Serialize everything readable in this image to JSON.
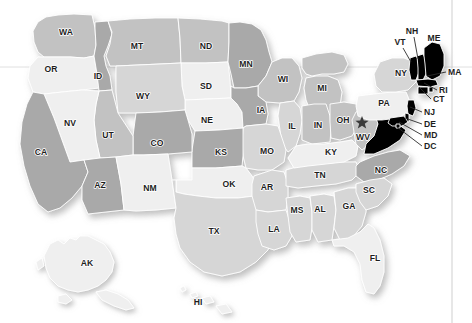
{
  "map": {
    "title": "United States choropleth map",
    "width": 472,
    "height": 323,
    "background_color": "#ffffff",
    "border_color": "#ffffff",
    "guide_line_color": "#d8d8d8",
    "right_rule_color": "#c9c9c9",
    "shade_levels": {
      "light": "#efefef",
      "medium_light": "#d6d6d6",
      "medium": "#c2c2c2",
      "dark": "#a9a9a9"
    },
    "marker": {
      "name": "star-marker",
      "state": "WV",
      "glyph": "star",
      "color": "#3a3a3a",
      "x": 362,
      "y": 122
    },
    "states": [
      {
        "code": "WA",
        "label_x": 66,
        "label_y": 33,
        "shade": "medium"
      },
      {
        "code": "OR",
        "label_x": 51,
        "label_y": 70,
        "shade": "light"
      },
      {
        "code": "ID",
        "label_x": 98,
        "label_y": 77,
        "shade": "dark"
      },
      {
        "code": "MT",
        "label_x": 137,
        "label_y": 47,
        "shade": "medium"
      },
      {
        "code": "ND",
        "label_x": 206,
        "label_y": 47,
        "shade": "medium"
      },
      {
        "code": "MN",
        "label_x": 246,
        "label_y": 65,
        "shade": "dark"
      },
      {
        "code": "WI",
        "label_x": 283,
        "label_y": 80,
        "shade": "medium"
      },
      {
        "code": "SD",
        "label_x": 206,
        "label_y": 87,
        "shade": "light"
      },
      {
        "code": "WY",
        "label_x": 143,
        "label_y": 97,
        "shade": "medium_light"
      },
      {
        "code": "NV",
        "label_x": 70,
        "label_y": 124,
        "shade": "light"
      },
      {
        "code": "UT",
        "label_x": 108,
        "label_y": 136,
        "shade": "medium"
      },
      {
        "code": "CO",
        "label_x": 157,
        "label_y": 144,
        "shade": "dark"
      },
      {
        "code": "NE",
        "label_x": 207,
        "label_y": 121,
        "shade": "light"
      },
      {
        "code": "IA",
        "label_x": 261,
        "label_y": 111,
        "shade": "dark"
      },
      {
        "code": "MI",
        "label_x": 322,
        "label_y": 89,
        "shade": "medium"
      },
      {
        "code": "IL",
        "label_x": 292,
        "label_y": 127,
        "shade": "medium_light"
      },
      {
        "code": "IN",
        "label_x": 318,
        "label_y": 126,
        "shade": "medium"
      },
      {
        "code": "OH",
        "label_x": 343,
        "label_y": 121,
        "shade": "medium"
      },
      {
        "code": "PA",
        "label_x": 384,
        "label_y": 104,
        "shade": "light"
      },
      {
        "code": "NY",
        "label_x": 401,
        "label_y": 74,
        "shade": "medium_light"
      },
      {
        "code": "CA",
        "label_x": 41,
        "label_y": 153,
        "shade": "dark"
      },
      {
        "code": "KS",
        "label_x": 221,
        "label_y": 153,
        "shade": "dark"
      },
      {
        "code": "MO",
        "label_x": 267,
        "label_y": 152,
        "shade": "medium_light"
      },
      {
        "code": "KY",
        "label_x": 331,
        "label_y": 153,
        "shade": "light"
      },
      {
        "code": "WV",
        "label_x": 363,
        "label_y": 138,
        "shade": "medium"
      },
      {
        "code": "AZ",
        "label_x": 100,
        "label_y": 186,
        "shade": "dark"
      },
      {
        "code": "NM",
        "label_x": 150,
        "label_y": 189,
        "shade": "light"
      },
      {
        "code": "OK",
        "label_x": 229,
        "label_y": 185,
        "shade": "light"
      },
      {
        "code": "AR",
        "label_x": 267,
        "label_y": 188,
        "shade": "medium_light"
      },
      {
        "code": "TN",
        "label_x": 320,
        "label_y": 176,
        "shade": "medium_light"
      },
      {
        "code": "NC",
        "label_x": 381,
        "label_y": 171,
        "shade": "dark"
      },
      {
        "code": "SC",
        "label_x": 369,
        "label_y": 191,
        "shade": "medium_light"
      },
      {
        "code": "MS",
        "label_x": 297,
        "label_y": 211,
        "shade": "medium_light"
      },
      {
        "code": "AL",
        "label_x": 320,
        "label_y": 210,
        "shade": "medium_light"
      },
      {
        "code": "GA",
        "label_x": 349,
        "label_y": 207,
        "shade": "medium_light"
      },
      {
        "code": "TX",
        "label_x": 214,
        "label_y": 232,
        "shade": "medium_light"
      },
      {
        "code": "LA",
        "label_x": 274,
        "label_y": 230,
        "shade": "medium_light"
      },
      {
        "code": "FL",
        "label_x": 375,
        "label_y": 259,
        "shade": "light"
      },
      {
        "code": "AK",
        "label_x": 87,
        "label_y": 264,
        "shade": "light"
      },
      {
        "code": "HI",
        "label_x": 198,
        "label_y": 303,
        "shade": "light"
      }
    ],
    "callouts": [
      {
        "code": "VT",
        "label_x": 400,
        "label_y": 43,
        "anchor": "middle",
        "line": "M403,48 L411,62"
      },
      {
        "code": "NH",
        "label_x": 412,
        "label_y": 32,
        "anchor": "middle",
        "line": "M414,37 L418,59"
      },
      {
        "code": "ME",
        "label_x": 434,
        "label_y": 39,
        "anchor": "middle",
        "line": ""
      },
      {
        "code": "MA",
        "label_x": 448,
        "label_y": 73,
        "anchor": "start",
        "line": "M446,72 L427,76"
      },
      {
        "code": "RI",
        "label_x": 439,
        "label_y": 91,
        "anchor": "start",
        "line": "M437,90 L424,83"
      },
      {
        "code": "CT",
        "label_x": 433,
        "label_y": 100,
        "anchor": "start",
        "line": "M431,99 L419,87"
      },
      {
        "code": "NJ",
        "label_x": 424,
        "label_y": 113,
        "anchor": "start",
        "line": "M422,112 L410,107"
      },
      {
        "code": "DE",
        "label_x": 424,
        "label_y": 125,
        "anchor": "start",
        "line": "M422,124 L405,118"
      },
      {
        "code": "MD",
        "label_x": 424,
        "label_y": 136,
        "anchor": "start",
        "line": "M422,135 L399,122"
      },
      {
        "code": "DC",
        "label_x": 424,
        "label_y": 147,
        "anchor": "start",
        "line": "M422,146 L397,127"
      }
    ]
  }
}
